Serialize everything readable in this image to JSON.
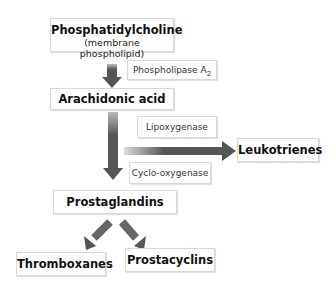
{
  "diagram": {
    "nodes": {
      "phosphatidylcholine": {
        "label": "Phosphatidylcholine",
        "sublabel": "(membrane phospholipid)"
      },
      "arachidonic_acid": {
        "label": "Arachidonic acid"
      },
      "leukotrienes": {
        "label": "Leukotrienes"
      },
      "prostaglandins": {
        "label": "Prostaglandins"
      },
      "thromboxanes": {
        "label": "Thromboxanes"
      },
      "prostacyclins": {
        "label": "Prostacyclins"
      }
    },
    "enzymes": {
      "phospholipase": {
        "label": "Phospholipase A",
        "subscript": "2"
      },
      "lipoxygenase": {
        "label": "Lipoxygenase"
      },
      "cyclooxygenase": {
        "label": "Cyclo-oxygenase"
      }
    },
    "edges": [
      {
        "from": "phosphatidylcholine",
        "to": "arachidonic_acid",
        "enzyme": "phospholipase"
      },
      {
        "from": "arachidonic_acid",
        "to": "leukotrienes",
        "enzyme": "lipoxygenase"
      },
      {
        "from": "arachidonic_acid",
        "to": "prostaglandins",
        "enzyme": "cyclooxygenase"
      },
      {
        "from": "prostaglandins",
        "to": "thromboxanes"
      },
      {
        "from": "prostaglandins",
        "to": "prostacyclins"
      }
    ],
    "colors": {
      "arrow": "#555555",
      "box_border": "#d8d8d8"
    }
  }
}
